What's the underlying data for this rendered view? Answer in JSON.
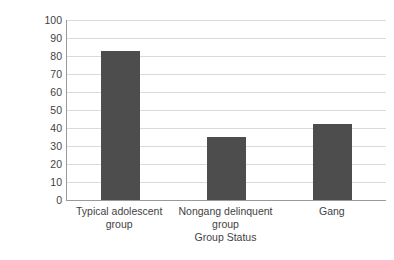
{
  "chart_data": {
    "type": "bar",
    "title": "",
    "subtitle": "",
    "categories": [
      "Typical adolescent group",
      "Nongang delinquent group",
      "Gang"
    ],
    "values": [
      83,
      35,
      42
    ],
    "xlabel": "Group Status",
    "ylabel": "Percent",
    "ylim": [
      0,
      100
    ],
    "ytick_step": 10,
    "yticks": [
      100,
      90,
      80,
      70,
      60,
      50,
      40,
      30,
      20,
      10,
      0
    ],
    "grid": "horizontal",
    "legend": "none",
    "series": [
      {
        "name": "Percent",
        "values": [
          83,
          35,
          42
        ]
      }
    ],
    "colors": {
      "bar": "#4d4d4d",
      "gridline": "#dadada",
      "axis": "#9a9a9a",
      "text": "#3f3f3f",
      "background": "#ffffff"
    }
  }
}
